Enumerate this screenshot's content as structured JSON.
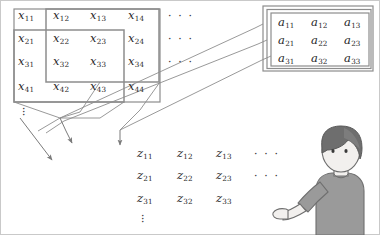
{
  "figure": {
    "background": "#ffffff",
    "stroke_color": "#8a8a8a",
    "text_color": "#262626",
    "border_color": "#b9b9b9"
  },
  "input_matrix": {
    "name": "x",
    "rows": [
      [
        "x",
        "x",
        "x",
        "x"
      ],
      [
        "x",
        "x",
        "x",
        "x"
      ],
      [
        "x",
        "x",
        "x",
        "x"
      ],
      [
        "x",
        "x",
        "x",
        "x"
      ]
    ],
    "cells": [
      [
        {
          "base": "x",
          "sub": "11"
        },
        {
          "base": "x",
          "sub": "12"
        },
        {
          "base": "x",
          "sub": "13"
        },
        {
          "base": "x",
          "sub": "14"
        }
      ],
      [
        {
          "base": "x",
          "sub": "21"
        },
        {
          "base": "x",
          "sub": "22"
        },
        {
          "base": "x",
          "sub": "23"
        },
        {
          "base": "x",
          "sub": "24"
        }
      ],
      [
        {
          "base": "x",
          "sub": "31"
        },
        {
          "base": "x",
          "sub": "32"
        },
        {
          "base": "x",
          "sub": "33"
        },
        {
          "base": "x",
          "sub": "34"
        }
      ],
      [
        {
          "base": "x",
          "sub": "41"
        },
        {
          "base": "x",
          "sub": "42"
        },
        {
          "base": "x",
          "sub": "43"
        },
        {
          "base": "x",
          "sub": "44"
        }
      ]
    ],
    "row_ellipses": [
      "· · ·",
      "· · ·",
      "· · ·"
    ],
    "column_vdots": "⋮",
    "windows": [
      {
        "id": "window-1",
        "label": "receptive-field-top-left"
      },
      {
        "id": "window-2",
        "label": "receptive-field-shifted-right"
      },
      {
        "id": "window-3",
        "label": "receptive-field-rows-2-4"
      }
    ]
  },
  "kernel_matrix": {
    "name": "a",
    "cells": [
      [
        {
          "base": "a",
          "sub": "11"
        },
        {
          "base": "a",
          "sub": "12"
        },
        {
          "base": "a",
          "sub": "13"
        }
      ],
      [
        {
          "base": "a",
          "sub": "21"
        },
        {
          "base": "a",
          "sub": "22"
        },
        {
          "base": "a",
          "sub": "23"
        }
      ],
      [
        {
          "base": "a",
          "sub": "31"
        },
        {
          "base": "a",
          "sub": "32"
        },
        {
          "base": "a",
          "sub": "33"
        }
      ]
    ]
  },
  "output_matrix": {
    "name": "z",
    "cells": [
      [
        {
          "base": "z",
          "sub": "11"
        },
        {
          "base": "z",
          "sub": "12"
        },
        {
          "base": "z",
          "sub": "13"
        }
      ],
      [
        {
          "base": "z",
          "sub": "21"
        },
        {
          "base": "z",
          "sub": "22"
        },
        {
          "base": "z",
          "sub": "23"
        }
      ],
      [
        {
          "base": "z",
          "sub": "31"
        },
        {
          "base": "z",
          "sub": "32"
        },
        {
          "base": "z",
          "sub": "33"
        }
      ]
    ],
    "row_ellipses": [
      "· · ·",
      "· · ·"
    ],
    "column_vdots": "⋮"
  },
  "person": {
    "label": "person-illustration",
    "hair_color": "#6e6e6e",
    "skin_color": "#f2f0ee",
    "shirt_color": "#9a9a9a",
    "pose": "pointing-left"
  }
}
